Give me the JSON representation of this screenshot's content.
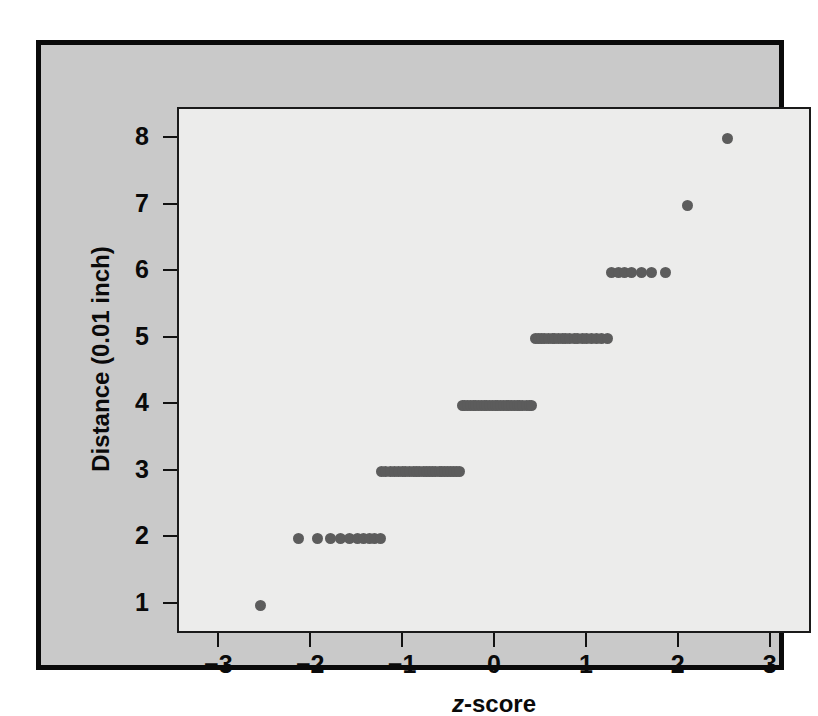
{
  "chart_data": {
    "type": "scatter",
    "title": "",
    "xlabel": "z-score",
    "xlabel_italic_part": "z",
    "xlabel_rest": "-score",
    "ylabel": "Distance (0.01 inch)",
    "xlim": [
      -3.45,
      3.45
    ],
    "ylim": [
      0.55,
      8.45
    ],
    "xticks": [
      -3,
      -2,
      -1,
      0,
      1,
      2,
      3
    ],
    "xticklabels": [
      "−3",
      "−2",
      "−1",
      "0",
      "1",
      "2",
      "3"
    ],
    "yticks": [
      1,
      2,
      3,
      4,
      5,
      6,
      7,
      8
    ],
    "yticklabels": [
      "1",
      "2",
      "3",
      "4",
      "5",
      "6",
      "7",
      "8"
    ],
    "grid": false,
    "legend": false,
    "marker": "circle",
    "marker_color": "#5c5c5c",
    "marker_size_px": 11,
    "points": [
      {
        "x": -2.56,
        "y": 1
      },
      {
        "x": -2.15,
        "y": 2
      },
      {
        "x": -1.94,
        "y": 2
      },
      {
        "x": -1.8,
        "y": 2
      },
      {
        "x": -1.69,
        "y": 2
      },
      {
        "x": -1.59,
        "y": 2
      },
      {
        "x": -1.51,
        "y": 2
      },
      {
        "x": -1.44,
        "y": 2
      },
      {
        "x": -1.38,
        "y": 2
      },
      {
        "x": -1.32,
        "y": 2
      },
      {
        "x": -1.26,
        "y": 2
      },
      {
        "x": -1.25,
        "y": 3
      },
      {
        "x": -1.2,
        "y": 3
      },
      {
        "x": -1.15,
        "y": 3
      },
      {
        "x": -1.1,
        "y": 3
      },
      {
        "x": -1.06,
        "y": 3
      },
      {
        "x": -1.02,
        "y": 3
      },
      {
        "x": -0.98,
        "y": 3
      },
      {
        "x": -0.94,
        "y": 3
      },
      {
        "x": -0.9,
        "y": 3
      },
      {
        "x": -0.86,
        "y": 3
      },
      {
        "x": -0.83,
        "y": 3
      },
      {
        "x": -0.79,
        "y": 3
      },
      {
        "x": -0.76,
        "y": 3
      },
      {
        "x": -0.72,
        "y": 3
      },
      {
        "x": -0.69,
        "y": 3
      },
      {
        "x": -0.66,
        "y": 3
      },
      {
        "x": -0.62,
        "y": 3
      },
      {
        "x": -0.59,
        "y": 3
      },
      {
        "x": -0.56,
        "y": 3
      },
      {
        "x": -0.53,
        "y": 3
      },
      {
        "x": -0.5,
        "y": 3
      },
      {
        "x": -0.46,
        "y": 3
      },
      {
        "x": -0.43,
        "y": 3
      },
      {
        "x": -0.4,
        "y": 3
      },
      {
        "x": -0.37,
        "y": 4
      },
      {
        "x": -0.34,
        "y": 4
      },
      {
        "x": -0.31,
        "y": 4
      },
      {
        "x": -0.28,
        "y": 4
      },
      {
        "x": -0.25,
        "y": 4
      },
      {
        "x": -0.22,
        "y": 4
      },
      {
        "x": -0.19,
        "y": 4
      },
      {
        "x": -0.16,
        "y": 4
      },
      {
        "x": -0.13,
        "y": 4
      },
      {
        "x": -0.1,
        "y": 4
      },
      {
        "x": -0.07,
        "y": 4
      },
      {
        "x": -0.04,
        "y": 4
      },
      {
        "x": -0.01,
        "y": 4
      },
      {
        "x": 0.02,
        "y": 4
      },
      {
        "x": 0.05,
        "y": 4
      },
      {
        "x": 0.08,
        "y": 4
      },
      {
        "x": 0.11,
        "y": 4
      },
      {
        "x": 0.14,
        "y": 4
      },
      {
        "x": 0.17,
        "y": 4
      },
      {
        "x": 0.2,
        "y": 4
      },
      {
        "x": 0.23,
        "y": 4
      },
      {
        "x": 0.26,
        "y": 4
      },
      {
        "x": 0.29,
        "y": 4
      },
      {
        "x": 0.33,
        "y": 4
      },
      {
        "x": 0.36,
        "y": 4
      },
      {
        "x": 0.39,
        "y": 4
      },
      {
        "x": 0.43,
        "y": 5
      },
      {
        "x": 0.46,
        "y": 5
      },
      {
        "x": 0.5,
        "y": 5
      },
      {
        "x": 0.53,
        "y": 5
      },
      {
        "x": 0.57,
        "y": 5
      },
      {
        "x": 0.61,
        "y": 5
      },
      {
        "x": 0.64,
        "y": 5
      },
      {
        "x": 0.68,
        "y": 5
      },
      {
        "x": 0.72,
        "y": 5
      },
      {
        "x": 0.76,
        "y": 5
      },
      {
        "x": 0.8,
        "y": 5
      },
      {
        "x": 0.85,
        "y": 5
      },
      {
        "x": 0.89,
        "y": 5
      },
      {
        "x": 0.94,
        "y": 5
      },
      {
        "x": 0.99,
        "y": 5
      },
      {
        "x": 1.04,
        "y": 5
      },
      {
        "x": 1.09,
        "y": 5
      },
      {
        "x": 1.15,
        "y": 5
      },
      {
        "x": 1.21,
        "y": 5
      },
      {
        "x": 1.26,
        "y": 6
      },
      {
        "x": 1.33,
        "y": 6
      },
      {
        "x": 1.4,
        "y": 6
      },
      {
        "x": 1.48,
        "y": 6
      },
      {
        "x": 1.58,
        "y": 6
      },
      {
        "x": 1.69,
        "y": 6
      },
      {
        "x": 1.84,
        "y": 6
      },
      {
        "x": 2.08,
        "y": 7
      },
      {
        "x": 2.52,
        "y": 8
      }
    ]
  }
}
